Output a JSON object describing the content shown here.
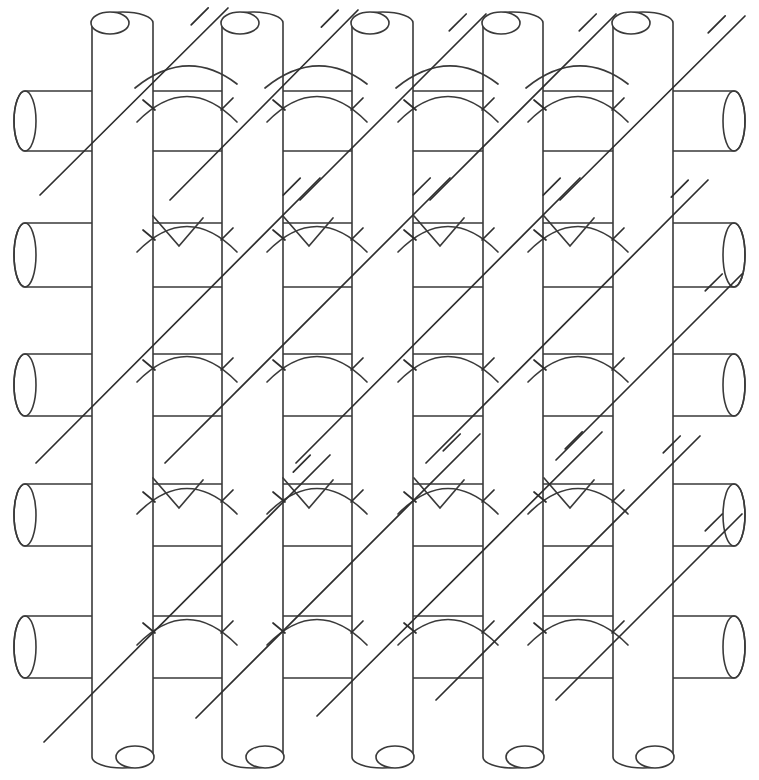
{
  "figure": {
    "background_color": "#ffffff",
    "line_color": "#3a3a3a",
    "bias_color": "#2e2e2e",
    "canvas": {
      "width": 759,
      "height": 780
    }
  },
  "geometry": {
    "vertical_tubes": [
      {
        "id": "v1",
        "x_left": 92,
        "x_right": 153,
        "y_top": 12,
        "y_bottom": 768
      },
      {
        "id": "v2",
        "x_left": 222,
        "x_right": 283,
        "y_top": 12,
        "y_bottom": 768
      },
      {
        "id": "v3",
        "x_left": 352,
        "x_right": 413,
        "y_top": 12,
        "y_bottom": 768
      },
      {
        "id": "v4",
        "x_left": 483,
        "x_right": 543,
        "y_top": 12,
        "y_bottom": 768
      },
      {
        "id": "v5",
        "x_left": 613,
        "x_right": 673,
        "y_top": 12,
        "y_bottom": 768
      }
    ],
    "horizontal_tubes": [
      {
        "id": "h1",
        "y_top": 91,
        "y_bottom": 151,
        "x_left": 14,
        "x_right": 745
      },
      {
        "id": "h2",
        "y_top": 223,
        "y_bottom": 287,
        "x_left": 14,
        "x_right": 745
      },
      {
        "id": "h3",
        "y_top": 354,
        "y_bottom": 416,
        "x_left": 14,
        "x_right": 745
      },
      {
        "id": "h4",
        "y_top": 484,
        "y_bottom": 546,
        "x_left": 14,
        "x_right": 745
      },
      {
        "id": "h5",
        "y_top": 616,
        "y_bottom": 678,
        "x_left": 14,
        "x_right": 745
      }
    ],
    "tube_width": 61,
    "vertical_pitch": 130,
    "horizontal_pitch": 131,
    "cap_ellipse_rx": 19,
    "cap_ellipse_ry": 11
  },
  "weave": {
    "note": "Arc marks indicate the horizontal strand bowing over a vertical strand; V marks indicate crossing of bias strands",
    "arc_rows_top": [
      60,
      190,
      320,
      452,
      583
    ],
    "arc_columns": [
      187,
      317,
      448,
      578
    ],
    "v_mark_rows": [
      190,
      452
    ],
    "arc_span": 100,
    "arc_rise": 34
  },
  "bias_strands": {
    "direction": "lower-left to upper-right",
    "slope_deg": 45,
    "count": 9,
    "dash_marks_per_crossing": 2,
    "lines": [
      {
        "x1": 40,
        "y1": 195,
        "x2": 228,
        "y2": 8
      },
      {
        "x1": 36,
        "y1": 463,
        "x2": 320,
        "y2": 178
      },
      {
        "x1": 44,
        "y1": 742,
        "x2": 330,
        "y2": 455
      },
      {
        "x1": 170,
        "y1": 200,
        "x2": 358,
        "y2": 10
      },
      {
        "x1": 165,
        "y1": 463,
        "x2": 450,
        "y2": 178
      },
      {
        "x1": 196,
        "y1": 718,
        "x2": 480,
        "y2": 434
      },
      {
        "x1": 300,
        "y1": 200,
        "x2": 486,
        "y2": 14
      },
      {
        "x1": 296,
        "y1": 463,
        "x2": 580,
        "y2": 178
      },
      {
        "x1": 317,
        "y1": 716,
        "x2": 602,
        "y2": 432
      },
      {
        "x1": 430,
        "y1": 200,
        "x2": 616,
        "y2": 14
      },
      {
        "x1": 426,
        "y1": 463,
        "x2": 708,
        "y2": 180
      },
      {
        "x1": 436,
        "y1": 700,
        "x2": 700,
        "y2": 436
      },
      {
        "x1": 560,
        "y1": 200,
        "x2": 745,
        "y2": 16
      },
      {
        "x1": 556,
        "y1": 460,
        "x2": 742,
        "y2": 274
      },
      {
        "x1": 556,
        "y1": 700,
        "x2": 742,
        "y2": 514
      }
    ]
  },
  "legend": {
    "vertical_strand_label": "vertical tubular strand",
    "horizontal_strand_label": "horizontal tubular strand",
    "bias_strand_label": "diagonal bias strand",
    "crossing_label": "over/under crossing"
  }
}
